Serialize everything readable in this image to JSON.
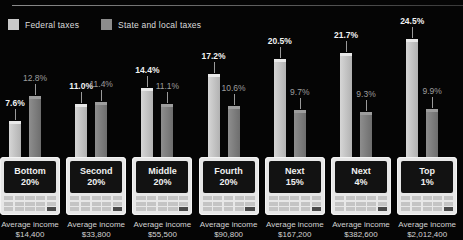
{
  "legend": {
    "items": [
      {
        "label": "Federal taxes",
        "icon": "square-swatch",
        "color": "#c9c9c9"
      },
      {
        "label": "State and local taxes",
        "icon": "square-swatch",
        "color": "#8c8c8c"
      }
    ]
  },
  "caption_prefix": "Average income",
  "chart_data": {
    "type": "bar",
    "title": "",
    "subtitle": "",
    "xlabel": "",
    "ylabel": "",
    "ylim": [
      0,
      25
    ],
    "grid": false,
    "legend_position": "top-left",
    "categories": [
      "Bottom 20%",
      "Second 20%",
      "Middle 20%",
      "Fourth 20%",
      "Next 15%",
      "Next 4%",
      "Top 1%"
    ],
    "series": [
      {
        "name": "Federal taxes",
        "color": "#c9c9c9",
        "values": [
          7.6,
          11.0,
          14.4,
          17.2,
          20.5,
          21.7,
          24.5
        ]
      },
      {
        "name": "State and local taxes",
        "color": "#8c8c8c",
        "values": [
          12.8,
          11.4,
          11.1,
          10.6,
          9.7,
          9.3,
          9.9
        ]
      }
    ],
    "value_labels": {
      "federal": [
        "7.6%",
        "11.0%",
        "14.4%",
        "17.2%",
        "20.5%",
        "21.7%",
        "24.5%"
      ],
      "state_local": [
        "12.8%",
        "11.4%",
        "11.1%",
        "10.6%",
        "9.7%",
        "9.3%",
        "9.9%"
      ]
    },
    "annotations": [
      "Average income $14,400",
      "Average income $33,800",
      "Average income $55,500",
      "Average income $90,800",
      "Average income $167,200",
      "Average income $382,600",
      "Average income $2,012,400"
    ]
  },
  "groups": [
    {
      "line1": "Bottom",
      "line2": "20%",
      "fed_label": "7.6%",
      "sl_label": "12.8%",
      "income_line1": "Average income",
      "income_line2": "$14,400"
    },
    {
      "line1": "Second",
      "line2": "20%",
      "fed_label": "11.0%",
      "sl_label": "11.4%",
      "income_line1": "Average income",
      "income_line2": "$33,800"
    },
    {
      "line1": "Middle",
      "line2": "20%",
      "fed_label": "14.4%",
      "sl_label": "11.1%",
      "income_line1": "Average income",
      "income_line2": "$55,500"
    },
    {
      "line1": "Fourth",
      "line2": "20%",
      "fed_label": "17.2%",
      "sl_label": "10.6%",
      "income_line1": "Average income",
      "income_line2": "$90,800"
    },
    {
      "line1": "Next",
      "line2": "15%",
      "fed_label": "20.5%",
      "sl_label": "9.7%",
      "income_line1": "Average income",
      "income_line2": "$167,200"
    },
    {
      "line1": "Next",
      "line2": "4%",
      "fed_label": "21.7%",
      "sl_label": "9.3%",
      "income_line1": "Average income",
      "income_line2": "$382,600"
    },
    {
      "line1": "Top",
      "line2": "1%",
      "fed_label": "24.5%",
      "sl_label": "9.9%",
      "income_line1": "Average income",
      "income_line2": "$2,012,400"
    }
  ]
}
